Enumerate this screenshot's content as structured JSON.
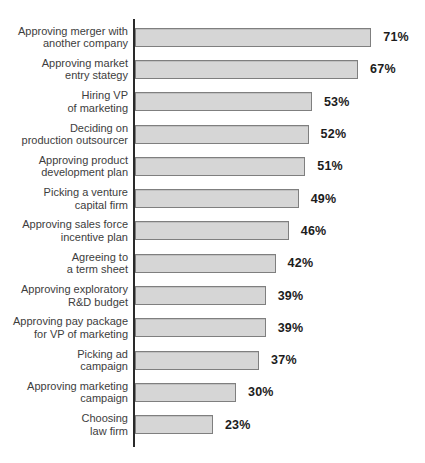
{
  "chart_data": {
    "type": "bar",
    "orientation": "horizontal",
    "title": "",
    "xlabel": "",
    "ylabel": "",
    "xlim": [
      0,
      88
    ],
    "grid": false,
    "legend": false,
    "categories": [
      "Approving merger with\nanother company",
      "Approving market\nentry stategy",
      "Hiring VP\nof marketing",
      "Deciding on\nproduction outsourcer",
      "Approving product\ndevelopment plan",
      "Picking a venture\ncapital firm",
      "Approving sales force\nincentive plan",
      "Agreeing to\na term sheet",
      "Approving exploratory\nR&D budget",
      "Approving pay package\nfor VP of marketing",
      "Picking ad\ncampaign",
      "Approving marketing\ncampaign",
      "Choosing\nlaw firm"
    ],
    "values": [
      71,
      67,
      53,
      52,
      51,
      49,
      46,
      42,
      39,
      39,
      37,
      30,
      23
    ],
    "value_labels": [
      "71%",
      "67%",
      "53%",
      "52%",
      "51%",
      "49%",
      "46%",
      "42%",
      "39%",
      "39%",
      "37%",
      "30%",
      "23%"
    ],
    "bar_color": "#d6d6d6",
    "bar_border_color": "#7f7f7f",
    "axis_color": "#2a2a2a",
    "label_color": "#3d3d3d",
    "value_color": "#1c1c1c"
  }
}
